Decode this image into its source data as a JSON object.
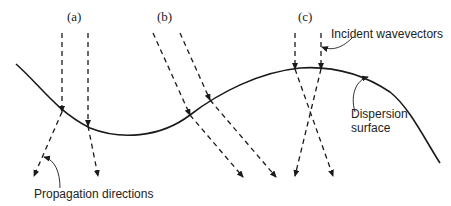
{
  "labels": {
    "case_a": "(a)",
    "case_b": "(b)",
    "case_c": "(c)",
    "incident": "Incident wavevectors",
    "dispersion_line1": "Dispersion",
    "dispersion_line2": "surface",
    "propagation": "Propagation directions"
  },
  "colors": {
    "stroke": "#1a1a1a",
    "text": "#222222"
  }
}
